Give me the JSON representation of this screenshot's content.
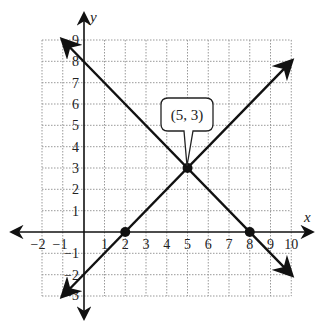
{
  "graph": {
    "x_axis_label": "x",
    "y_axis_label": "y",
    "x_range": [
      -2,
      10
    ],
    "y_range": [
      -3,
      9
    ],
    "x_ticks": [
      "−2",
      "−1",
      "1",
      "2",
      "3",
      "4",
      "5",
      "6",
      "7",
      "8",
      "9",
      "10"
    ],
    "y_ticks": [
      "9",
      "8",
      "7",
      "6",
      "5",
      "4",
      "3",
      "2",
      "1",
      "−1",
      "−2",
      "−3"
    ],
    "callout_label": "(5, 3)",
    "lines": [
      {
        "name": "decreasing-line",
        "equation": "y = -x + 8",
        "from": [
          -1,
          9
        ],
        "to": [
          10,
          -2
        ]
      },
      {
        "name": "increasing-line",
        "equation": "y = x - 2",
        "from": [
          -1,
          -3
        ],
        "to": [
          10,
          8
        ]
      }
    ],
    "points": [
      {
        "name": "intersection",
        "x": 5,
        "y": 3
      },
      {
        "name": "x-intercept-2",
        "x": 2,
        "y": 0
      },
      {
        "name": "x-intercept-8",
        "x": 8,
        "y": 0
      }
    ]
  }
}
